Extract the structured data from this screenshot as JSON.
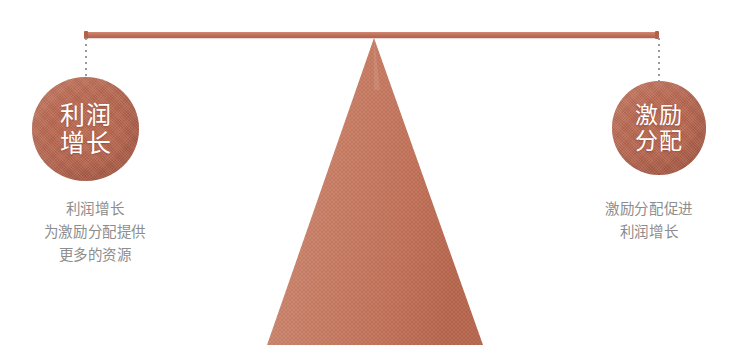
{
  "diagram": {
    "type": "balance-scale-seesaw",
    "title": "",
    "colors": {
      "beam": "#c2705a",
      "circle": "#bd6b53",
      "triangle": "#c47a61",
      "circle_text": "#ffffff",
      "caption_text": "#8d8d8d",
      "drop_line": "#9a9a9a",
      "background": "#ffffff"
    },
    "beam": {
      "name": "balance-beam",
      "left_x": 85,
      "right_x": 659,
      "y": 32,
      "thickness": 6
    },
    "fulcrum": {
      "name": "fulcrum-triangle",
      "apex_x": 374,
      "apex_y": 38,
      "base_left_x": 267,
      "base_right_x": 483,
      "base_y": 345
    },
    "left": {
      "circle": {
        "name": "profit-growth-node",
        "lines": [
          "利润",
          "增长"
        ],
        "center_x": 85,
        "center_y": 129,
        "radius": 53
      },
      "caption": {
        "name": "profit-growth-caption",
        "lines": [
          "利润增长",
          "为激励分配提供",
          "更多的资源"
        ]
      }
    },
    "right": {
      "circle": {
        "name": "incentive-allocation-node",
        "lines": [
          "激励",
          "分配"
        ],
        "center_x": 659,
        "center_y": 128,
        "radius": 47
      },
      "caption": {
        "name": "incentive-allocation-caption",
        "lines": [
          "激励分配促进",
          "利润增长"
        ]
      }
    }
  }
}
